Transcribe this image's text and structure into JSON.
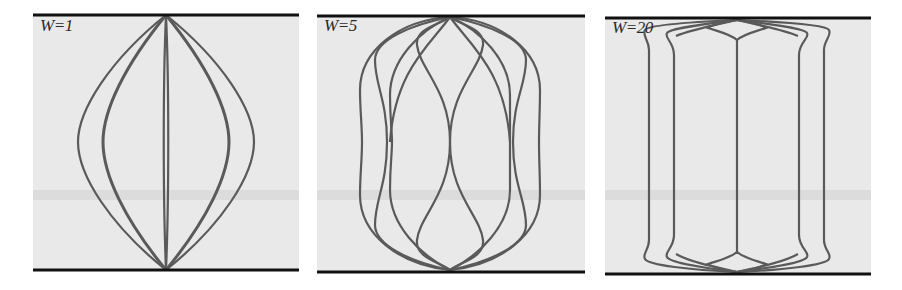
{
  "figure": {
    "style": {
      "background": "#e9e9e9",
      "band_color": "#dcdcdc",
      "plate_color": "#111111",
      "curve_color": "#5a5a5a"
    },
    "panels": [
      {
        "label": "W=1",
        "x": 33,
        "width": 266,
        "top": 15,
        "bottom": 270,
        "center_x": 166,
        "mid_xs": [
          78,
          103,
          166,
          226,
          251
        ]
      },
      {
        "label": "W=5",
        "x": 317,
        "width": 268,
        "top": 15,
        "bottom": 272,
        "center_x": 450,
        "mid_xs": [
          362,
          387,
          450,
          513,
          539
        ]
      },
      {
        "label": "W=20",
        "x": 605,
        "width": 266,
        "top": 17,
        "bottom": 274,
        "center_x": 737,
        "mid_xs": [
          649,
          674,
          737,
          799,
          824
        ]
      }
    ]
  }
}
